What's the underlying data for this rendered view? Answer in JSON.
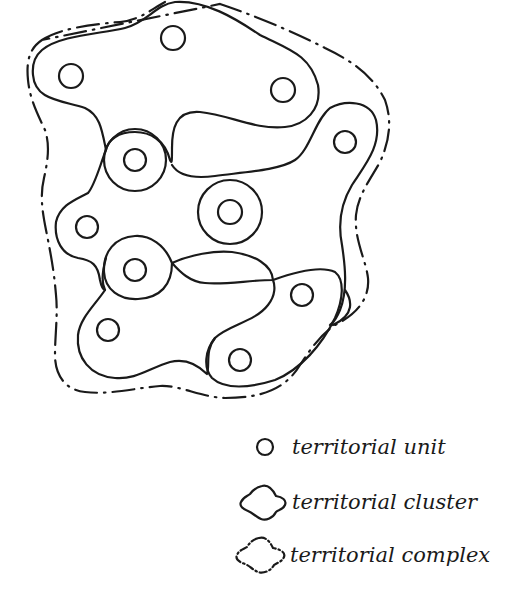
{
  "diagram": {
    "ink_color": "#1a1a1a",
    "background": "#ffffff",
    "units": [
      {
        "cx": 173,
        "cy": 38
      },
      {
        "cx": 71,
        "cy": 76
      },
      {
        "cx": 283,
        "cy": 90
      },
      {
        "cx": 345,
        "cy": 142
      },
      {
        "cx": 135,
        "cy": 160
      },
      {
        "cx": 230,
        "cy": 212
      },
      {
        "cx": 87,
        "cy": 227
      },
      {
        "cx": 135,
        "cy": 270
      },
      {
        "cx": 302,
        "cy": 295
      },
      {
        "cx": 108,
        "cy": 330
      },
      {
        "cx": 240,
        "cy": 360
      }
    ]
  },
  "legend": {
    "items": [
      {
        "symbol": "circle",
        "label": "territorial unit"
      },
      {
        "symbol": "solid-blob",
        "label": "territorial cluster"
      },
      {
        "symbol": "dash-dot-blob",
        "label": "territorial complex"
      }
    ]
  }
}
